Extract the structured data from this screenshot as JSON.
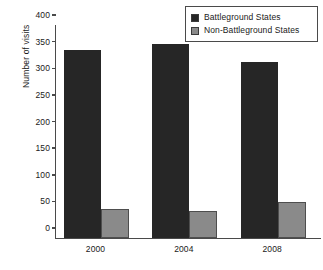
{
  "chart_data": {
    "type": "bar",
    "title": "",
    "xlabel": "",
    "ylabel": "Number of visits",
    "categories": [
      "2000",
      "2004",
      "2008"
    ],
    "series": [
      {
        "name": "Battleground States",
        "color": "#262626",
        "values": [
          353,
          364,
          330
        ]
      },
      {
        "name": "Non-Battleground States",
        "color": "#8a8a8a",
        "values": [
          54,
          50,
          67
        ]
      }
    ],
    "ylim": [
      0,
      400
    ],
    "yticks": [
      0,
      50,
      100,
      150,
      200,
      250,
      300,
      350,
      400
    ],
    "ytick_labels": [
      "0",
      "50",
      "100",
      "150",
      "200",
      "250",
      "300",
      "350",
      "400"
    ],
    "grid": false,
    "legend_position": "top-right"
  },
  "legend": {
    "items": [
      {
        "label": "Battleground States",
        "swatch": "dark-square-swatch"
      },
      {
        "label": "Non-Battleground States",
        "swatch": "gray-square-swatch"
      }
    ]
  }
}
